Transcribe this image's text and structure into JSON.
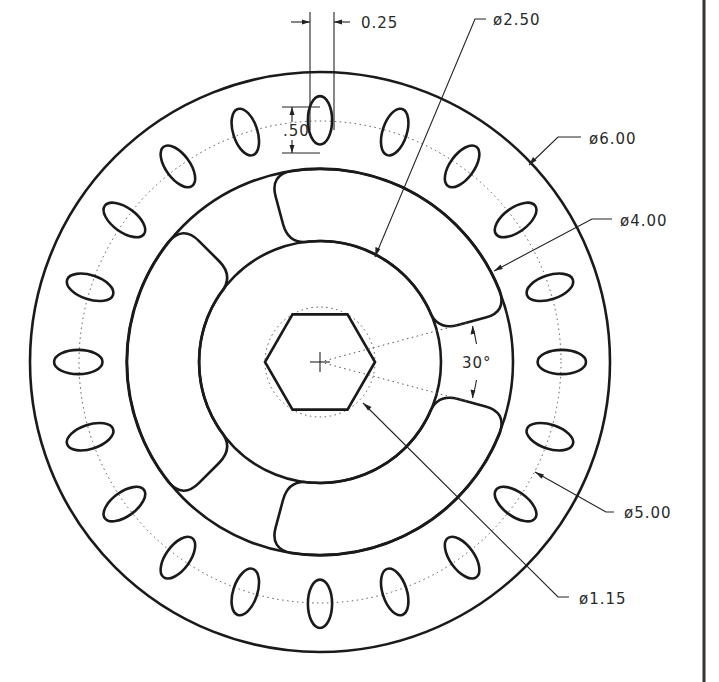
{
  "drawing": {
    "type": "technical-drawing",
    "subject": "flanged wheel / hub with slotted bolt circle and hex center",
    "units": "in",
    "center_px": [
      320,
      362
    ],
    "scale_px_per_unit": 96.7,
    "line_color": "#1a1a1a",
    "border_color": "#333333"
  },
  "dimensions": {
    "slot_width": "0.25",
    "slot_height": ".50",
    "dia_2_50": "ø2.50",
    "dia_6_00": "ø6.00",
    "dia_4_00": "ø4.00",
    "dia_5_00": "ø5.00",
    "dia_1_15": "ø1.15",
    "angle": "30°"
  },
  "features": {
    "outer_diameter": 6.0,
    "bolt_circle_diameter": 5.0,
    "inner_ring_diameter": 4.0,
    "hub_diameter": 2.5,
    "hex_across_corners": 1.15,
    "slot_count": 20,
    "slot_size": [
      0.25,
      0.5
    ],
    "pocket_count": 3,
    "pocket_gap_angle_deg": 30
  }
}
